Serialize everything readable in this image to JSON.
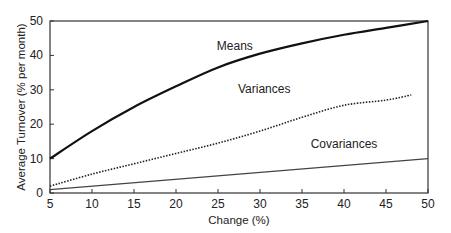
{
  "chart_data": {
    "type": "line",
    "title": "",
    "xlabel": "Change (%)",
    "ylabel": "Average Turnover (% per month)",
    "xlim": [
      5,
      50
    ],
    "ylim": [
      0,
      50
    ],
    "xticks": [
      5,
      10,
      15,
      20,
      25,
      30,
      35,
      40,
      45,
      50
    ],
    "yticks": [
      0,
      10,
      20,
      30,
      40,
      50
    ],
    "grid": false,
    "legend": "inline labels",
    "series": [
      {
        "name": "Means",
        "style": "solid-thick",
        "x": [
          5,
          10,
          15,
          20,
          25,
          30,
          35,
          40,
          45,
          50
        ],
        "values": [
          10,
          18,
          25,
          31,
          36.5,
          40.5,
          43.5,
          46,
          48,
          50
        ],
        "label_pos": [
          27,
          41.5
        ]
      },
      {
        "name": "Variances",
        "style": "dotted",
        "x": [
          5,
          10,
          15,
          20,
          25,
          30,
          35,
          40,
          45,
          48
        ],
        "values": [
          2,
          5.5,
          8.5,
          11.5,
          14.5,
          18,
          22,
          25.5,
          27,
          28.5
        ],
        "label_pos": [
          30.5,
          29
        ]
      },
      {
        "name": "Covariances",
        "style": "solid-thin",
        "x": [
          5,
          50
        ],
        "values": [
          1,
          10
        ],
        "label_pos": [
          40,
          13
        ]
      }
    ]
  }
}
